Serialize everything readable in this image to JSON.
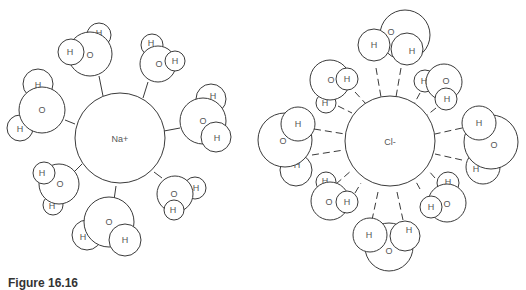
{
  "diagram": {
    "left_ion": {
      "label": "Na+",
      "interaction": "solid",
      "waters": [
        {
          "o": "O",
          "h1": "H",
          "h2": "H"
        },
        {
          "o": "O",
          "h1": "H",
          "h2": "H"
        },
        {
          "o": "O",
          "h1": "H",
          "h2": "H"
        },
        {
          "o": "O",
          "h1": "H",
          "h2": "H"
        },
        {
          "o": "O",
          "h1": "H",
          "h2": "H"
        },
        {
          "o": "O",
          "h1": "H",
          "h2": "H"
        }
      ]
    },
    "right_ion": {
      "label": "Cl-",
      "interaction": "dashed",
      "waters": [
        {
          "o": "O",
          "h1": "H",
          "h2": "H"
        },
        {
          "o": "O",
          "h1": "H",
          "h2": "H"
        },
        {
          "o": "O",
          "h1": "H",
          "h2": "H"
        },
        {
          "o": "O",
          "h1": "H",
          "h2": "H"
        },
        {
          "o": "O",
          "h1": "H",
          "h2": "H"
        },
        {
          "o": "O",
          "h1": "H",
          "h2": "H"
        }
      ]
    }
  },
  "caption": {
    "label": "Figure 16.16",
    "text": ""
  }
}
